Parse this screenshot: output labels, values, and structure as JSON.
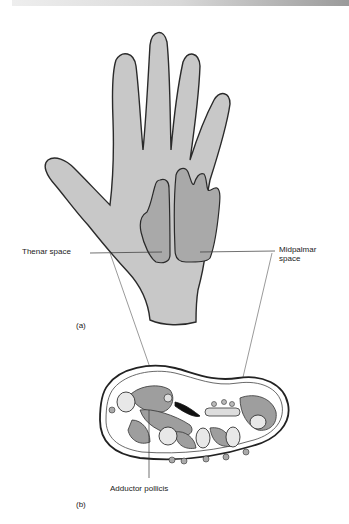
{
  "figure": {
    "panel_a": {
      "label": "(a)",
      "labels": {
        "thenar": "Thenar space",
        "midpalmar_line1": "Midpalmar",
        "midpalmar_line2": "space"
      }
    },
    "panel_b": {
      "label": "(b)",
      "labels": {
        "adductor": "Adductor pollicis"
      }
    },
    "colors": {
      "hand_fill": "#c8c8c8",
      "space_fill": "#a9a9a9",
      "outline": "#2a2a2a",
      "muscle_fill": "#9e9e9e",
      "bone_fill": "#e8e8e8"
    }
  }
}
